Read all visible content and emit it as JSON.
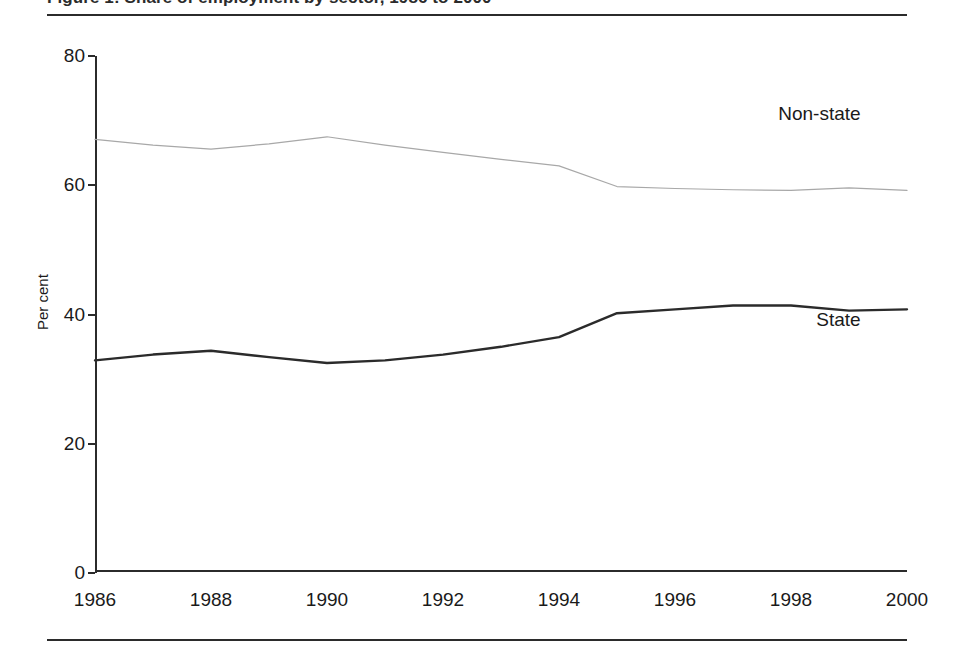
{
  "figure": {
    "clipped_title_text": "Figure 1: Share of employment by sector, 1986 to 2000",
    "ylabel": "Per cent",
    "yticks": [
      "0",
      "20",
      "40",
      "60",
      "80"
    ],
    "xticks": [
      "1986",
      "1988",
      "1990",
      "1992",
      "1994",
      "1996",
      "1998",
      "2000"
    ],
    "series_labels": {
      "nonstate": "Non-state",
      "state": "State"
    },
    "colors": {
      "nonstate_line": "#a8a8a8",
      "state_line": "#2b2b2b",
      "axis": "#2b2b2b",
      "text": "#1a1a1a",
      "background": "#ffffff"
    }
  },
  "chart_data": {
    "type": "line",
    "title": "Share of employment by sector, 1986 to 2000",
    "xlabel": "",
    "ylabel": "Per cent",
    "xlim": [
      1986,
      2000
    ],
    "ylim": [
      0,
      80
    ],
    "yticks": [
      0,
      20,
      40,
      60,
      80
    ],
    "xticks": [
      1986,
      1988,
      1990,
      1992,
      1994,
      1996,
      1998,
      2000
    ],
    "grid": false,
    "legend": "inline-annotations",
    "x": [
      1986,
      1987,
      1988,
      1989,
      1990,
      1991,
      1992,
      1993,
      1994,
      1995,
      1996,
      1997,
      1998,
      1999,
      2000
    ],
    "series": [
      {
        "name": "Non-state",
        "color": "#a8a8a8",
        "line_style": "thin",
        "values": [
          67.1,
          66.2,
          65.6,
          66.4,
          67.5,
          66.2,
          65.1,
          64.0,
          63.0,
          59.8,
          59.5,
          59.3,
          59.2,
          59.6,
          59.2
        ],
        "label_position": {
          "x": 1999.2,
          "y": 71.0
        }
      },
      {
        "name": "State",
        "color": "#2b2b2b",
        "line_style": "thick",
        "values": [
          32.9,
          33.8,
          34.4,
          33.4,
          32.5,
          32.9,
          33.8,
          35.0,
          36.5,
          40.2,
          40.8,
          41.4,
          41.4,
          40.6,
          40.8
        ],
        "label_position": {
          "x": 1999.2,
          "y": 39.2
        }
      }
    ]
  }
}
